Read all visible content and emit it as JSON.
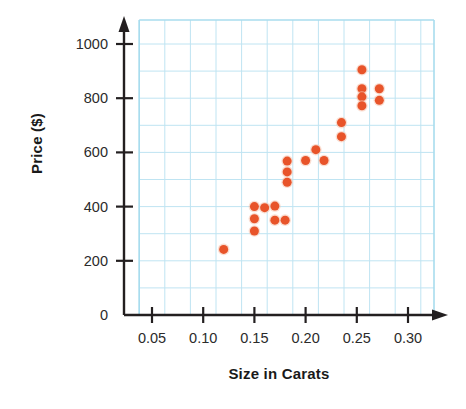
{
  "chart_data": {
    "type": "scatter",
    "title": "",
    "xlabel": "Size in Carats",
    "ylabel": "Price ($)",
    "xlim": [
      0.0,
      0.315
    ],
    "ylim": [
      0,
      1050
    ],
    "xticks": [
      "0.05",
      "0.10",
      "0.15",
      "0.20",
      "0.25",
      "0.30"
    ],
    "xtick_values": [
      0.05,
      0.1,
      0.15,
      0.2,
      0.25,
      0.3
    ],
    "yticks": [
      "0",
      "200",
      "400",
      "600",
      "800",
      "1000"
    ],
    "ytick_values": [
      0,
      200,
      400,
      600,
      800,
      1000
    ],
    "grid": true,
    "grid_color": "#bfe4f2",
    "grid_step_x": 0.025,
    "grid_step_y": 100,
    "axis_color": "#231f20",
    "marker_color": "#e8542a",
    "marker_size": 9,
    "legend": "none",
    "points": [
      {
        "x": 0.12,
        "y": 242
      },
      {
        "x": 0.15,
        "y": 400
      },
      {
        "x": 0.15,
        "y": 355
      },
      {
        "x": 0.15,
        "y": 310
      },
      {
        "x": 0.16,
        "y": 396
      },
      {
        "x": 0.17,
        "y": 402
      },
      {
        "x": 0.17,
        "y": 350
      },
      {
        "x": 0.18,
        "y": 350
      },
      {
        "x": 0.182,
        "y": 568
      },
      {
        "x": 0.182,
        "y": 528
      },
      {
        "x": 0.182,
        "y": 490
      },
      {
        "x": 0.2,
        "y": 570
      },
      {
        "x": 0.21,
        "y": 610
      },
      {
        "x": 0.218,
        "y": 570
      },
      {
        "x": 0.235,
        "y": 710
      },
      {
        "x": 0.235,
        "y": 658
      },
      {
        "x": 0.255,
        "y": 905
      },
      {
        "x": 0.255,
        "y": 835
      },
      {
        "x": 0.255,
        "y": 805
      },
      {
        "x": 0.255,
        "y": 772
      },
      {
        "x": 0.272,
        "y": 835
      },
      {
        "x": 0.272,
        "y": 792
      }
    ]
  }
}
